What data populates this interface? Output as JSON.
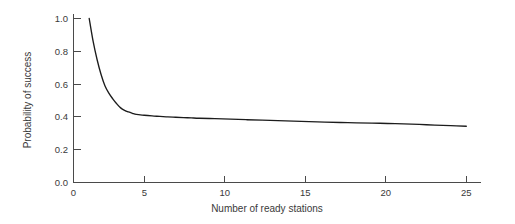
{
  "chart_data": {
    "type": "line",
    "title": "",
    "subtitle": "",
    "xlabel": "Number of ready stations",
    "ylabel": "Probability of success",
    "xlim": [
      0,
      26.5
    ],
    "ylim": [
      0.0,
      1.05
    ],
    "grid": false,
    "legend": null,
    "xticks": [
      0,
      5,
      10,
      15,
      20,
      25
    ],
    "xtick_labels": [
      "0",
      "5",
      "10",
      "15",
      "20",
      "25"
    ],
    "yticks": [
      0.0,
      0.2,
      0.4,
      0.6,
      0.8,
      1.0
    ],
    "ytick_labels": [
      "0.0",
      "0.2",
      "0.4",
      "0.6",
      "0.8",
      "1.0"
    ],
    "series": [
      {
        "name": "Probability of success",
        "color": "#1c1c1c",
        "x": [
          1,
          1.25,
          1.5,
          1.75,
          2,
          2.25,
          2.5,
          2.75,
          3,
          3.25,
          3.5,
          3.75,
          4,
          4.5,
          5,
          5.5,
          6,
          6.5,
          7,
          7.5,
          8,
          9,
          10,
          11,
          12,
          13,
          14,
          15,
          16,
          17,
          18,
          19,
          20,
          21,
          22,
          23,
          24,
          25
        ],
        "y": [
          1.0,
          0.86,
          0.75,
          0.66,
          0.59,
          0.545,
          0.51,
          0.48,
          0.455,
          0.44,
          0.43,
          0.422,
          0.415,
          0.41,
          0.406,
          0.403,
          0.4,
          0.398,
          0.396,
          0.394,
          0.392,
          0.389,
          0.386,
          0.383,
          0.38,
          0.377,
          0.374,
          0.371,
          0.368,
          0.366,
          0.364,
          0.362,
          0.36,
          0.357,
          0.354,
          0.35,
          0.347,
          0.343
        ]
      }
    ],
    "annotations": []
  },
  "axes": {
    "x_title": "Number of ready stations",
    "y_title": "Probability of success",
    "x_tick_labels": [
      "0",
      "5",
      "10",
      "15",
      "20",
      "25"
    ],
    "y_tick_labels": [
      "0.0",
      "0.2",
      "0.4",
      "0.6",
      "0.8",
      "1.0"
    ]
  },
  "colors": {
    "background": "#ffffff",
    "curve": "#1c1c1c",
    "axis": "#4a4a4a",
    "text": "#3a3a3a"
  }
}
